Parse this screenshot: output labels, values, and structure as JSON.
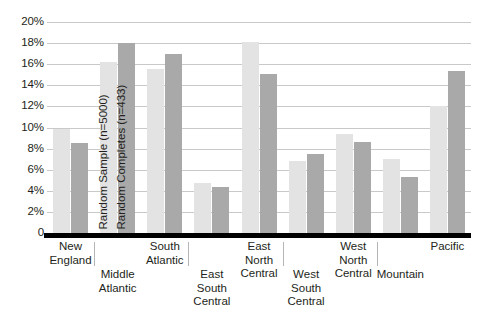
{
  "chart_data": {
    "type": "bar",
    "title": "",
    "subtitle": "",
    "xlabel": "",
    "ylabel": "",
    "ylim": [
      0,
      20
    ],
    "y_tick_labels": [
      "20%",
      "18%",
      "16%",
      "14%",
      "12%",
      "10%",
      "8%",
      "6%",
      "4%",
      "2%",
      "0"
    ],
    "y_tick_values": [
      20,
      18,
      16,
      14,
      12,
      10,
      8,
      6,
      4,
      2,
      0
    ],
    "grid": true,
    "grid_axis": "y",
    "legend_position": "in-plot-rotated-on-second-category-bars",
    "categories": [
      "New\nEngland",
      "Middle\nAtlantic",
      "South\nAtlantic",
      "East\nSouth\nCentral",
      "East\nNorth\nCentral",
      "West\nSouth\nCentral",
      "West\nNorth\nCentral",
      "Mountain",
      "Pacific"
    ],
    "series": [
      {
        "name": "Random Sample (n=5000)",
        "color": "#e3e3e3",
        "values": [
          9.9,
          16.2,
          15.5,
          4.7,
          18.1,
          6.8,
          9.4,
          7.0,
          12.0
        ]
      },
      {
        "name": "Random Completes (n=433)",
        "color": "#a9a9a9",
        "values": [
          8.5,
          18.0,
          17.0,
          4.4,
          15.1,
          7.5,
          8.6,
          5.3,
          15.4
        ]
      }
    ]
  },
  "axis": {
    "baseline_color": "#000000",
    "gridline_color": "#c9c9c9",
    "tick_color": "#b6b6b6"
  }
}
